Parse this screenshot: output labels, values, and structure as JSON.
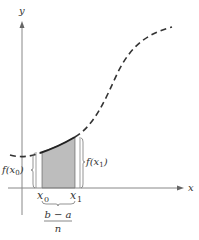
{
  "diagram": {
    "axes": {
      "x_label": "x",
      "y_label": "y"
    },
    "points": {
      "x0_label": "x",
      "x0_sub": "0",
      "x1_label": "x",
      "x1_sub": "1"
    },
    "function_labels": {
      "f_x0_prefix": "f(x",
      "f_x0_sub": "0",
      "f_x0_suffix": ")",
      "f_x1_prefix": "f(x",
      "f_x1_sub": "1",
      "f_x1_suffix": ")"
    },
    "width_label": {
      "numerator": "b − a",
      "denominator": "n"
    },
    "colors": {
      "axis": "#888888",
      "curve": "#333333",
      "shade": "#b8b8b8",
      "text": "#333333"
    }
  }
}
